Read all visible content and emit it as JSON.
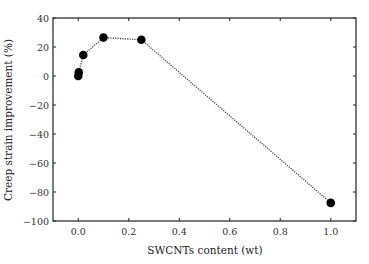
{
  "chart_data": {
    "type": "line",
    "title": "",
    "xlabel": "SWCNTs content (wt)",
    "ylabel": "Creep strain improvement (%)",
    "xlim": [
      -0.1,
      1.1
    ],
    "ylim": [
      -100,
      40
    ],
    "x_ticks": [
      0.0,
      0.2,
      0.4,
      0.6,
      0.8,
      1.0
    ],
    "x_tick_labels": [
      "0.0",
      "0.2",
      "0.4",
      "0.6",
      "0.8",
      "1.0"
    ],
    "y_ticks": [
      40,
      20,
      0,
      -20,
      -40,
      -60,
      -80,
      -100
    ],
    "y_tick_labels": [
      "40",
      "20",
      "0",
      "−20",
      "−40",
      "−60",
      "−80",
      "−100"
    ],
    "grid": false,
    "legend": null,
    "series": [
      {
        "name": "Creep strain improvement",
        "line_style": "dotted",
        "marker": "filled-circle",
        "color": "#000000",
        "x": [
          0.0,
          0.002,
          0.02,
          0.1,
          0.25,
          1.0
        ],
        "y": [
          0,
          2.5,
          14.5,
          26.5,
          25,
          -87.5
        ]
      }
    ]
  }
}
